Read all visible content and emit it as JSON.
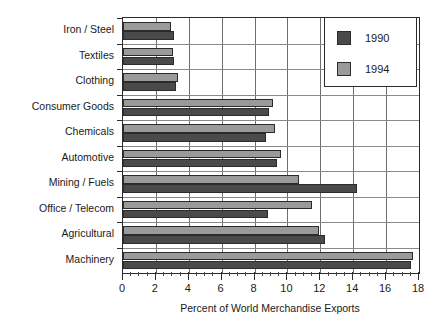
{
  "chart_data": {
    "type": "bar",
    "orientation": "horizontal",
    "title": "",
    "xlabel": "Percent of World Merchandise Exports",
    "ylabel": "",
    "xlim": [
      0,
      18
    ],
    "xticks": [
      0,
      2,
      4,
      6,
      8,
      10,
      12,
      14,
      16,
      18
    ],
    "xtick_labels": [
      "0",
      "2",
      "4",
      "6",
      "8",
      "10",
      "12",
      "14",
      "16",
      "18"
    ],
    "minor_tick_step": 0.5,
    "grid": "vertical-major-and-horizontal-category",
    "legend_position": "top-right",
    "categories": [
      "Iron / Steel",
      "Textiles",
      "Clothing",
      "Consumer Goods",
      "Chemicals",
      "Automotive",
      "Mining / Fuels",
      "Office / Telecom",
      "Agricultural",
      "Machinery"
    ],
    "series": [
      {
        "name": "1990",
        "color": "#4a4a4a",
        "values": [
          3.1,
          3.1,
          3.2,
          8.9,
          8.7,
          9.35,
          14.2,
          8.8,
          12.3,
          17.5
        ]
      },
      {
        "name": "1994",
        "color": "#9a9a9a",
        "values": [
          2.9,
          3.05,
          3.35,
          9.1,
          9.25,
          9.6,
          10.7,
          11.5,
          11.9,
          17.65
        ]
      }
    ]
  },
  "legend": {
    "entries": [
      {
        "label": "1990",
        "color": "#4a4a4a"
      },
      {
        "label": "1994",
        "color": "#9a9a9a"
      }
    ]
  },
  "axis": {
    "x_title": "Percent of World Merchandise Exports"
  }
}
